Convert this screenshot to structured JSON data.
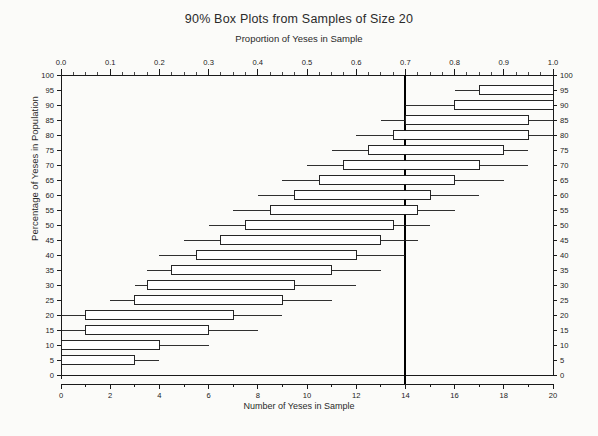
{
  "titles": {
    "main": "90% Box Plots from Samples of Size 20",
    "sub": "Proportion of Yeses in Sample",
    "xlabel_bottom": "Number of Yeses in Sample",
    "ylabel": "Percentage of Yeses in Population"
  },
  "chart_data": {
    "type": "box",
    "title": "90% Box Plots from Samples of Size 20",
    "subtitle": "Proportion of Yeses in Sample",
    "xlabel": "Number of Yeses in Sample",
    "xlabel_top": "Proportion of Yeses in Sample",
    "ylabel": "Percentage of Yeses in Population",
    "grid": false,
    "legend": "none",
    "sample_size": 20,
    "confidence": "90%",
    "xlim": [
      0,
      20
    ],
    "ylim": [
      0,
      100
    ],
    "x_ticks_bottom": [
      0,
      2,
      4,
      6,
      8,
      10,
      12,
      14,
      16,
      18,
      20
    ],
    "x_minor_step_bottom": 1,
    "x_ticks_top": [
      "0.0",
      "0.1",
      "0.2",
      "0.3",
      "0.4",
      "0.5",
      "0.6",
      "0.7",
      "0.8",
      "0.9",
      "1.0"
    ],
    "x_ticks_top_values": [
      0.0,
      0.1,
      0.2,
      0.3,
      0.4,
      0.5,
      0.6,
      0.7,
      0.8,
      0.9,
      1.0
    ],
    "y_ticks": [
      0,
      5,
      10,
      15,
      20,
      25,
      30,
      35,
      40,
      45,
      50,
      55,
      60,
      65,
      70,
      75,
      80,
      85,
      90,
      95,
      100
    ],
    "reference_line": {
      "x_number": 14,
      "x_proportion": 0.7,
      "orientation": "vertical",
      "color": "#000000",
      "width_px": 2
    },
    "colors": {
      "box_fill": "#ffffff",
      "box_stroke": "#1a1a1a",
      "whisker": "#1a1a1a",
      "axis": "#1a1a1a",
      "reference": "#000000"
    },
    "boxes": [
      {
        "population_pct": 100,
        "whisker_low": 20.0,
        "q1": 20.0,
        "q3": 20.0,
        "whisker_high": 20.0,
        "degenerate": true
      },
      {
        "population_pct": 95,
        "whisker_low": 16.0,
        "q1": 17.0,
        "q3": 20.0,
        "whisker_high": 20.0
      },
      {
        "population_pct": 90,
        "whisker_low": 14.0,
        "q1": 16.0,
        "q3": 20.0,
        "whisker_high": 20.0
      },
      {
        "population_pct": 85,
        "whisker_low": 13.0,
        "q1": 14.0,
        "q3": 19.0,
        "whisker_high": 20.0
      },
      {
        "population_pct": 80,
        "whisker_low": 12.0,
        "q1": 13.5,
        "q3": 19.0,
        "whisker_high": 20.0
      },
      {
        "population_pct": 75,
        "whisker_low": 11.0,
        "q1": 12.5,
        "q3": 18.0,
        "whisker_high": 19.0
      },
      {
        "population_pct": 70,
        "whisker_low": 10.0,
        "q1": 11.5,
        "q3": 17.0,
        "whisker_high": 19.0
      },
      {
        "population_pct": 65,
        "whisker_low": 9.0,
        "q1": 10.5,
        "q3": 16.0,
        "whisker_high": 18.0
      },
      {
        "population_pct": 60,
        "whisker_low": 8.0,
        "q1": 9.5,
        "q3": 15.0,
        "whisker_high": 17.0
      },
      {
        "population_pct": 55,
        "whisker_low": 7.0,
        "q1": 8.5,
        "q3": 14.5,
        "whisker_high": 16.0
      },
      {
        "population_pct": 50,
        "whisker_low": 6.0,
        "q1": 7.5,
        "q3": 13.5,
        "whisker_high": 15.0
      },
      {
        "population_pct": 45,
        "whisker_low": 5.0,
        "q1": 6.5,
        "q3": 13.0,
        "whisker_high": 14.5
      },
      {
        "population_pct": 40,
        "whisker_low": 4.0,
        "q1": 5.5,
        "q3": 12.0,
        "whisker_high": 14.0
      },
      {
        "population_pct": 35,
        "whisker_low": 3.5,
        "q1": 4.5,
        "q3": 11.0,
        "whisker_high": 13.0
      },
      {
        "population_pct": 30,
        "whisker_low": 3.0,
        "q1": 3.5,
        "q3": 9.5,
        "whisker_high": 12.0
      },
      {
        "population_pct": 25,
        "whisker_low": 2.0,
        "q1": 3.0,
        "q3": 9.0,
        "whisker_high": 11.0
      },
      {
        "population_pct": 20,
        "whisker_low": 0.0,
        "q1": 1.0,
        "q3": 7.0,
        "whisker_high": 9.0
      },
      {
        "population_pct": 15,
        "whisker_low": 0.0,
        "q1": 1.0,
        "q3": 6.0,
        "whisker_high": 8.0
      },
      {
        "population_pct": 10,
        "whisker_low": 0.0,
        "q1": 0.0,
        "q3": 4.0,
        "whisker_high": 6.0
      },
      {
        "population_pct": 5,
        "whisker_low": 0.0,
        "q1": 0.0,
        "q3": 3.0,
        "whisker_high": 4.0
      },
      {
        "population_pct": 0,
        "whisker_low": 0.0,
        "q1": 0.0,
        "q3": 0.0,
        "whisker_high": 0.0,
        "degenerate": true
      }
    ]
  }
}
